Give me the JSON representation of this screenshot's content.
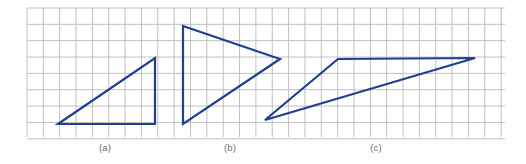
{
  "figure": {
    "name": "triangle-shapes-on-grid",
    "background_color": "#ffffff",
    "width": 526,
    "height": 164,
    "grid": {
      "line_color": "#b9b9b9",
      "line_width": 0.9,
      "cell_size": 16.35,
      "x_start": 27,
      "y_start": 8,
      "x_end": 505,
      "y_end": 137,
      "columns": 29,
      "rows": 8,
      "visible": true
    },
    "stroke_color": "#1f3f92",
    "stroke_width": 2.2,
    "shapes": [
      {
        "id": "shape-a",
        "label": "(a)",
        "type": "triangle",
        "fill": "none",
        "points": "58,124 155,58 155,124",
        "vertices": [
          {
            "x": 58,
            "y": 124
          },
          {
            "x": 155,
            "y": 58
          },
          {
            "x": 155,
            "y": 124
          }
        ],
        "label_x": 105,
        "label_y": 151
      },
      {
        "id": "shape-b",
        "label": "(b)",
        "type": "triangle",
        "fill": "none",
        "points": "183,26 280,59 183,124",
        "vertices": [
          {
            "x": 183,
            "y": 26
          },
          {
            "x": 280,
            "y": 59
          },
          {
            "x": 183,
            "y": 124
          }
        ],
        "label_x": 230,
        "label_y": 151
      },
      {
        "id": "shape-c",
        "label": "(c)",
        "type": "triangle",
        "fill": "none",
        "points": "265,120 338,59 475,58",
        "vertices": [
          {
            "x": 265,
            "y": 120
          },
          {
            "x": 338,
            "y": 59
          },
          {
            "x": 475,
            "y": 58
          }
        ],
        "label_x": 376,
        "label_y": 151
      }
    ],
    "captions": [
      {
        "text": "(a)",
        "x": 105,
        "y": 151
      },
      {
        "text": "(b)",
        "x": 230,
        "y": 151
      },
      {
        "text": "(c)",
        "x": 376,
        "y": 151
      }
    ],
    "caption_color": "#6d6d6d"
  }
}
